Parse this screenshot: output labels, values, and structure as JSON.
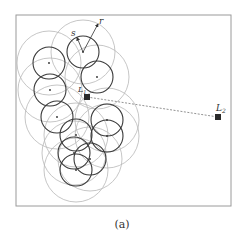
{
  "figure": {
    "caption": "(a)",
    "frame": {
      "x": 16,
      "y": 15,
      "width": 215,
      "height": 191,
      "color": "#9a9a9a"
    },
    "colors": {
      "sensing_circle": "#3a3a3a",
      "comm_circle": "#b8b8b8",
      "node": "#2a2a2a",
      "link": "#777777"
    },
    "radius_labels": {
      "s": "s",
      "r": "r"
    },
    "radii": {
      "inner": 16,
      "outer": 32
    },
    "nodes": [
      {
        "x": 83,
        "y": 52
      },
      {
        "x": 97,
        "y": 77
      },
      {
        "x": 49,
        "y": 63
      },
      {
        "x": 50,
        "y": 90
      },
      {
        "x": 57,
        "y": 117
      },
      {
        "x": 107,
        "y": 120
      },
      {
        "x": 107,
        "y": 136
      },
      {
        "x": 76,
        "y": 135
      },
      {
        "x": 74,
        "y": 153
      },
      {
        "x": 90,
        "y": 159
      },
      {
        "x": 76,
        "y": 170
      }
    ],
    "landmarks": [
      {
        "label": "L",
        "subscript": "1",
        "x": 87,
        "y": 97
      },
      {
        "label": "L",
        "subscript": "2",
        "x": 218,
        "y": 117
      }
    ]
  }
}
